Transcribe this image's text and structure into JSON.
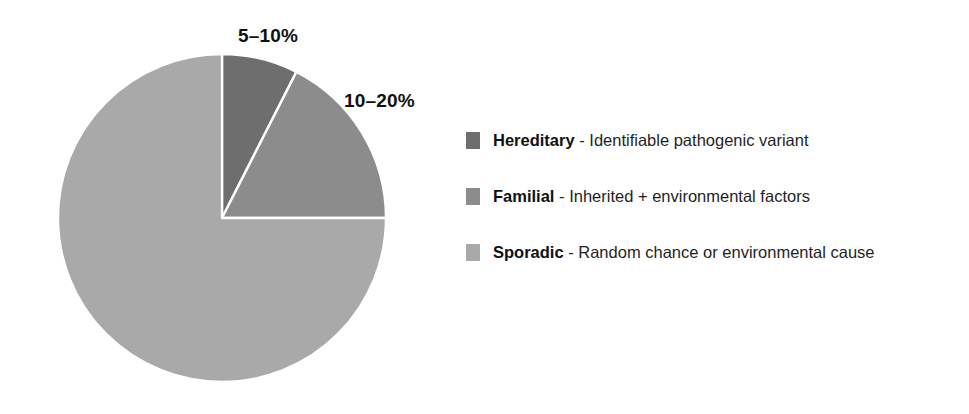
{
  "chart_data": {
    "type": "pie",
    "title": "",
    "subtitle": "",
    "xlabel": "",
    "ylabel": "",
    "legend_position": "right",
    "grid": false,
    "categories": [
      "Hereditary",
      "Familial",
      "Sporadic"
    ],
    "values": [
      7.5,
      17.5,
      75
    ],
    "value_labels": [
      "5–10%",
      "10–20%",
      ""
    ],
    "colors": [
      "#6e6e6e",
      "#8c8c8c",
      "#a9a9a9"
    ],
    "slice_separator_color": "#ffffff",
    "start_angle_deg": 0,
    "annotations": [
      {
        "text": "5–10%",
        "target": "Hereditary"
      },
      {
        "text": "10–20%",
        "target": "Familial"
      }
    ],
    "legend_entries": [
      {
        "term": "Hereditary",
        "dash": " - ",
        "description": "Identifiable pathogenic variant",
        "color": "#6e6e6e"
      },
      {
        "term": "Familial",
        "dash": " - ",
        "description": "Inherited + environmental factors",
        "color": "#8c8c8c"
      },
      {
        "term": "Sporadic",
        "dash": " - ",
        "description": "Random chance or environmental cause",
        "color": "#a9a9a9"
      }
    ]
  },
  "labels": {
    "hereditary_pct": "5–10%",
    "familial_pct": "10–20%"
  },
  "legend": {
    "rows": [
      {
        "term": "Hereditary",
        "dash": " - ",
        "description": "Identifiable pathogenic variant"
      },
      {
        "term": "Familial",
        "dash": " - ",
        "description": "Inherited + environmental factors"
      },
      {
        "term": "Sporadic",
        "dash": " - ",
        "description": "Random chance or environmental cause"
      }
    ]
  },
  "background": "#ffffff"
}
